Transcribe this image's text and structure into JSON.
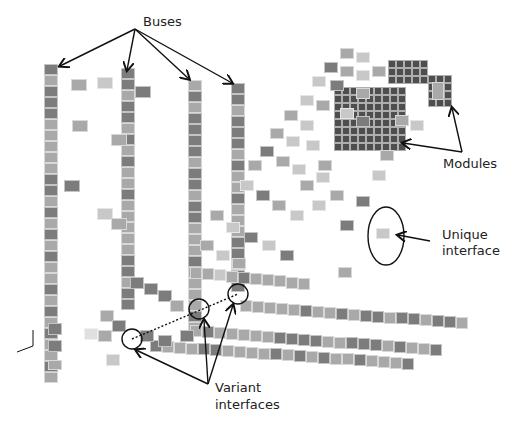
{
  "labels": {
    "buses": "Buses",
    "modules": "Modules",
    "unique_interface_line1": "Unique",
    "unique_interface_line2": "interface",
    "variant_interfaces_line1": "Variant",
    "variant_interfaces_line2": "interfaces"
  },
  "colors": {
    "dark": "#7c7c7c",
    "darker": "#4e4e4e",
    "mid": "#a9a9a9",
    "light": "#c8c8c8",
    "annotation": "#111111"
  }
}
